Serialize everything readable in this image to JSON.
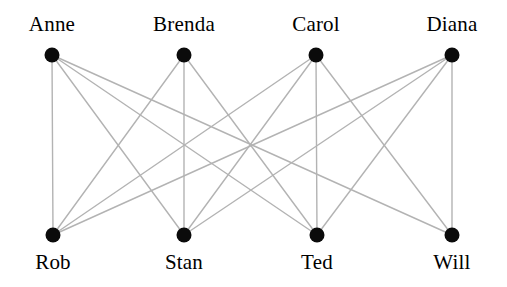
{
  "diagram": {
    "type": "bipartite-graph",
    "title": "",
    "width": 507,
    "height": 287,
    "style": {
      "node_color": "#0b0b0b",
      "node_radius": 7.5,
      "edge_color": "#b3b3b3",
      "edge_width": 1.4,
      "label_color": "#000000",
      "background": "#ffffff"
    },
    "top_row": {
      "y": 55,
      "label_y": 12,
      "nodes": [
        {
          "id": "anne",
          "label": "Anne",
          "x": 52
        },
        {
          "id": "brenda",
          "label": "Brenda",
          "x": 184
        },
        {
          "id": "carol",
          "label": "Carol",
          "x": 316
        },
        {
          "id": "diana",
          "label": "Diana",
          "x": 452
        }
      ]
    },
    "bottom_row": {
      "y": 235,
      "label_y": 250,
      "nodes": [
        {
          "id": "rob",
          "label": "Rob",
          "x": 53
        },
        {
          "id": "stan",
          "label": "Stan",
          "x": 184
        },
        {
          "id": "ted",
          "label": "Ted",
          "x": 317
        },
        {
          "id": "will",
          "label": "Will",
          "x": 452
        }
      ]
    },
    "edges": [
      {
        "from": "anne",
        "to": "rob"
      },
      {
        "from": "anne",
        "to": "stan"
      },
      {
        "from": "anne",
        "to": "ted"
      },
      {
        "from": "anne",
        "to": "will"
      },
      {
        "from": "brenda",
        "to": "rob"
      },
      {
        "from": "brenda",
        "to": "stan"
      },
      {
        "from": "brenda",
        "to": "ted"
      },
      {
        "from": "carol",
        "to": "rob"
      },
      {
        "from": "carol",
        "to": "stan"
      },
      {
        "from": "carol",
        "to": "ted"
      },
      {
        "from": "carol",
        "to": "will"
      },
      {
        "from": "diana",
        "to": "rob"
      },
      {
        "from": "diana",
        "to": "stan"
      },
      {
        "from": "diana",
        "to": "ted"
      },
      {
        "from": "diana",
        "to": "will"
      }
    ]
  }
}
